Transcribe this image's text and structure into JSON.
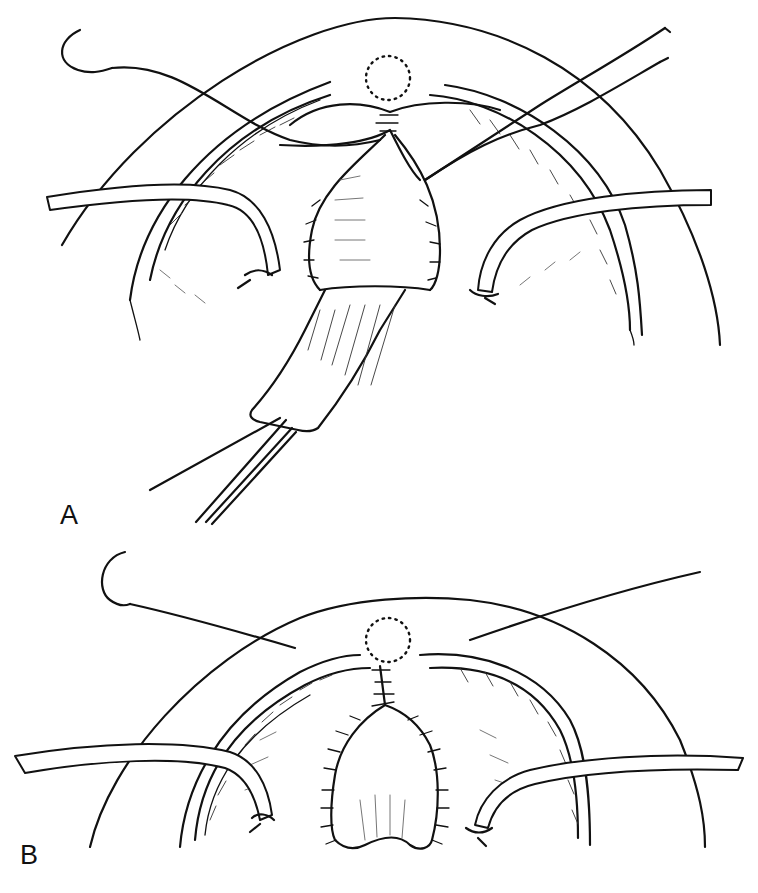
{
  "figure": {
    "type": "surgical-illustration",
    "panels": [
      {
        "id": "A",
        "label": "A",
        "elements": [
          "curved-needle-with-suture",
          "forceps",
          "two-retractor-hooks",
          "tissue-flap-held-by-clamp",
          "dotted-circle-marker",
          "interrupted-sutures"
        ]
      },
      {
        "id": "B",
        "label": "B",
        "elements": [
          "curved-needle-with-suture",
          "two-retractor-hooks",
          "dotted-circle-marker",
          "closed-interrupted-suture-line"
        ]
      }
    ]
  },
  "colors": {
    "ink": "#111111",
    "background": "#ffffff"
  }
}
